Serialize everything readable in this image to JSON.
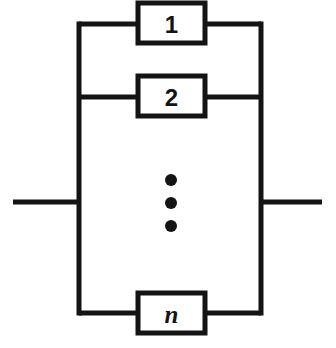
{
  "diagram": {
    "type": "parallel-block-diagram",
    "colors": {
      "background": "#ffffff",
      "line": "#141414",
      "box_fill": "#ffffff"
    },
    "blocks": [
      {
        "id": "block-1",
        "label": "1",
        "style": "sans-bold",
        "x": 138,
        "y": 3,
        "width": 67,
        "height": 40,
        "branch_y": 24
      },
      {
        "id": "block-2",
        "label": "2",
        "style": "sans-bold",
        "x": 138,
        "y": 76,
        "width": 67,
        "height": 40,
        "branch_y": 97
      },
      {
        "id": "block-n",
        "label": "n",
        "style": "italic-serif",
        "x": 138,
        "y": 293,
        "width": 67,
        "height": 40,
        "branch_y": 313
      }
    ],
    "ellipsis": {
      "label": "vertical-ellipsis",
      "dots": [
        {
          "cx": 171,
          "cy": 180,
          "r": 6
        },
        {
          "cx": 171,
          "cy": 203,
          "r": 6
        },
        {
          "cx": 171,
          "cy": 226,
          "r": 6
        }
      ]
    },
    "rails": {
      "left_x": 79,
      "right_x": 261,
      "top_y": 24,
      "bottom_y": 313
    },
    "terminals": {
      "left": {
        "label": "left-terminal-lead",
        "x1": 13,
        "x2": 79,
        "y": 202
      },
      "right": {
        "label": "right-terminal-lead",
        "x1": 261,
        "x2": 322,
        "y": 202
      }
    }
  }
}
